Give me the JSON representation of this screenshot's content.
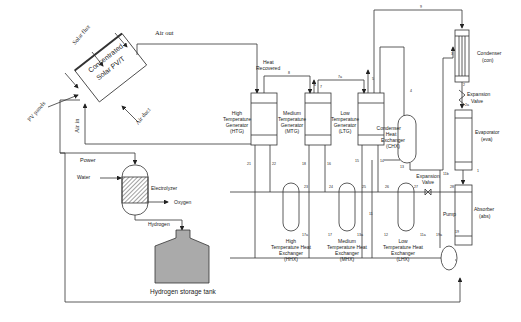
{
  "diagram": {
    "cpvt": {
      "title_line1": "Concentrated",
      "title_line2": "Solar PV/T",
      "solar_flux": "Solar flux",
      "pv_panels": "PV panels",
      "air_duct": "Air duct",
      "air_out": "Air out",
      "air_in": "Air in"
    },
    "electrolysis": {
      "power": "Power",
      "water": "Water",
      "electrolyzer": "Electrolyzer",
      "oxygen": "Oxygen",
      "hydrogen": "Hydrogen",
      "tank": "Hydrogen storage tank"
    },
    "heat_recovered_1": "Heat",
    "heat_recovered_2": "Recovered",
    "generators": [
      {
        "l1": "High",
        "l2": "Temperature",
        "l3": "Generator",
        "l4": "(HTG)"
      },
      {
        "l1": "Medium",
        "l2": "Temperature",
        "l3": "Generator",
        "l4": "(MTG)"
      },
      {
        "l1": "Low",
        "l2": "Temperature",
        "l3": "Generator",
        "l4": "(LTG)"
      }
    ],
    "heat_exchangers": [
      {
        "l1": "High",
        "l2": "Temperature Heat",
        "l3": "Exchanger",
        "l4": "(HHX)"
      },
      {
        "l1": "Medium",
        "l2": "Temperature Heat",
        "l3": "Exchanger",
        "l4": "(MHX)"
      },
      {
        "l1": "Low",
        "l2": "Temperature Heat",
        "l3": "Exchanger",
        "l4": "(LHX)"
      }
    ],
    "chx": {
      "l1": "Condenser",
      "l2": "Heat",
      "l3": "Exchanger",
      "l4": "(CHX)"
    },
    "condenser": {
      "l1": "Condenser",
      "l2": "(con)"
    },
    "evaporator": {
      "l1": "Evaporator",
      "l2": "(eva)"
    },
    "absorber": {
      "l1": "Absorber",
      "l2": "(abs)"
    },
    "expansion_valve_top": {
      "l1": "Expansion",
      "l2": "Valve"
    },
    "expansion_valve_bottom": {
      "l1": "Expansion",
      "l2": "Valve"
    },
    "pump": "Pump",
    "state_points": {
      "s1": "1",
      "s2": "2",
      "s2a": "2a",
      "s3": "3",
      "s4": "4",
      "s5": "5",
      "s6": "6",
      "s7": "7",
      "s7a": "7a",
      "s8": "8",
      "s9": "9",
      "s11": "11",
      "s11a": "11a",
      "s11b": "11b",
      "s12": "12",
      "s13": "13",
      "s13a": "13a",
      "s14": "14",
      "s15": "15",
      "s16": "16",
      "s17": "17",
      "s17a": "17a",
      "s18": "18",
      "s19": "19",
      "s21": "21",
      "s22": "22",
      "s23": "23",
      "s24": "24",
      "s25": "25",
      "s26": "26",
      "s27": "27",
      "s28": "28",
      "s19a": "19a"
    }
  }
}
